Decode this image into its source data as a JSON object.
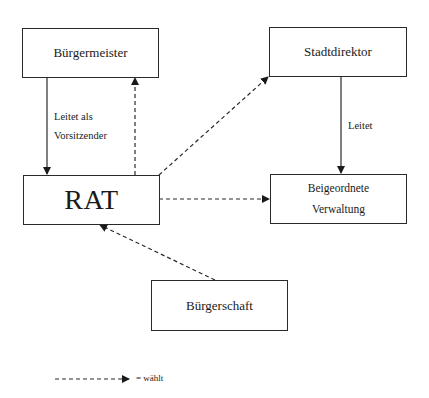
{
  "nodes": {
    "buergermeister": {
      "label": "Bürgermeister"
    },
    "stadtdirektor": {
      "label": "Stadtdirektor"
    },
    "rat": {
      "label": "RAT"
    },
    "beigeordnete": {
      "line1": "Beigeordnete",
      "line2": "Verwaltung"
    },
    "buergerschaft": {
      "label": "Bürgerschaft"
    }
  },
  "edges": [
    {
      "from": "Bürgermeister",
      "to": "RAT",
      "style": "solid",
      "label_line1": "Leitet als",
      "label_line2": "Vorsitzender"
    },
    {
      "from": "RAT",
      "to": "Bürgermeister",
      "style": "dashed",
      "meaning": "wählt"
    },
    {
      "from": "RAT",
      "to": "Stadtdirektor",
      "style": "dashed",
      "meaning": "wählt"
    },
    {
      "from": "Stadtdirektor",
      "to": "Beigeordnete Verwaltung",
      "style": "solid",
      "label": "Leitet"
    },
    {
      "from": "RAT",
      "to": "Beigeordnete Verwaltung",
      "style": "dashed",
      "meaning": "wählt"
    },
    {
      "from": "Bürgerschaft",
      "to": "RAT",
      "style": "dashed",
      "meaning": "wählt"
    }
  ],
  "edge_labels": {
    "bm_rat_line1": "Leitet als",
    "bm_rat_line2": "Vorsitzender",
    "sd_bv": "Leitet"
  },
  "legend": {
    "dashed_arrow_meaning": "= wählt"
  },
  "colors": {
    "line": "#2a2a2a",
    "background": "#ffffff"
  }
}
